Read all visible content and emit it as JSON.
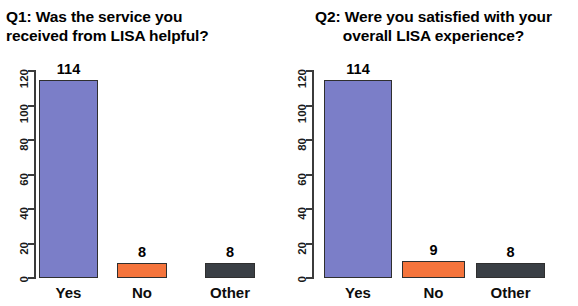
{
  "document": {
    "kind": "survey-results-bar-charts",
    "background_color": "#ffffff"
  },
  "palette": {
    "yes_bar": "#7b7ec8",
    "no_bar": "#f5743c",
    "other_bar": "#3a3f45",
    "axis": "#3b3b3b",
    "text": "#000000"
  },
  "panels": [
    {
      "id": "q1",
      "title": "Q1: Was the service you\nreceived from LISA helpful?",
      "title_align": "left"
    },
    {
      "id": "q2",
      "title": "Q2: Were you satisfied with your\noverall LISA experience?",
      "title_align": "center"
    }
  ],
  "axis": {
    "y_ticks": [
      "0",
      "20",
      "40",
      "60",
      "80",
      "100",
      "120"
    ],
    "x_categories": [
      "Yes",
      "No",
      "Other"
    ]
  },
  "chart_data": [
    {
      "type": "bar",
      "title": "Q1: Was the service you received from LISA helpful?",
      "categories": [
        "Yes",
        "No",
        "Other"
      ],
      "values": [
        114,
        8,
        8
      ],
      "data_labels": [
        "114",
        "8",
        "8"
      ],
      "colors": [
        "#7b7ec8",
        "#f5743c",
        "#3a3f45"
      ],
      "xlabel": "",
      "ylabel": "",
      "ylim": [
        0,
        120
      ],
      "yticks": [
        0,
        20,
        40,
        60,
        80,
        100,
        120
      ],
      "grid": false,
      "legend": false
    },
    {
      "type": "bar",
      "title": "Q2: Were you satisfied with your overall LISA experience?",
      "categories": [
        "Yes",
        "No",
        "Other"
      ],
      "values": [
        114,
        9,
        8
      ],
      "data_labels": [
        "114",
        "9",
        "8"
      ],
      "colors": [
        "#7b7ec8",
        "#f5743c",
        "#3a3f45"
      ],
      "xlabel": "",
      "ylabel": "",
      "ylim": [
        0,
        120
      ],
      "yticks": [
        0,
        20,
        40,
        60,
        80,
        100,
        120
      ],
      "grid": false,
      "legend": false
    }
  ]
}
